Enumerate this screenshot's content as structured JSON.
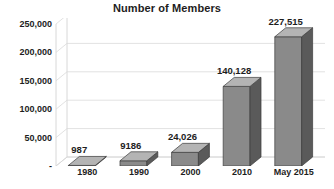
{
  "chart_data": {
    "type": "bar",
    "title": "Number of Members",
    "xlabel": "",
    "ylabel": "",
    "categories": [
      "1980",
      "1990",
      "2000",
      "2010",
      "May 2015"
    ],
    "values": [
      987,
      9186,
      24026,
      140128,
      227515
    ],
    "value_labels": [
      "987",
      "9186",
      "24,026",
      "140,128",
      "227,515"
    ],
    "ylim": [
      0,
      250000
    ],
    "ytick_values": [
      0,
      50000,
      100000,
      150000,
      200000,
      250000
    ],
    "ytick_labels": [
      "-",
      "50,000",
      "100,000",
      "150,000",
      "200,000",
      "250,000"
    ],
    "grid": true,
    "legend": false,
    "legend_position": "none",
    "style": "3d-column",
    "series": [
      {
        "name": "Number of Members",
        "values": [
          987,
          9186,
          24026,
          140128,
          227515
        ]
      }
    ]
  },
  "colors": {
    "bar_front": "#8a8a8a",
    "bar_side": "#5a5a5a",
    "bar_top": "#b4b4b4",
    "bar_outline": "#3c3c3c",
    "grid_line": "#e2e2e2",
    "wall_line": "#d8d8d8",
    "text": "#1d1d1d",
    "background": "#ffffff"
  }
}
